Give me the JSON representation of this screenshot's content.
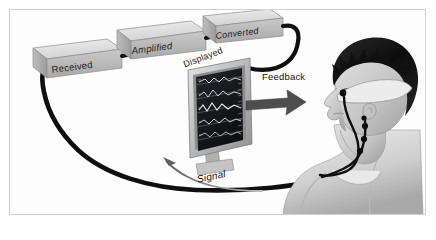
{
  "figure": {
    "kind": "biofeedback-system-diagram",
    "frame_border_color": "#cfd2d4",
    "background_color": "#fdfdfd",
    "cable_color": "#111111",
    "box_fill_color": "#d6d6d6",
    "arrow_color": "#5a5a5a"
  },
  "boxes": [
    {
      "label": "Received",
      "icon": "cube-icon"
    },
    {
      "label": "Amplified",
      "icon": "cube-icon"
    },
    {
      "label": "Converted",
      "icon": "cube-icon"
    }
  ],
  "monitor": {
    "label": "Displayed",
    "icon": "monitor-icon",
    "screen_color": "#17181c",
    "trace_color": "#d8dadd",
    "trace_count": 6
  },
  "arrows": [
    {
      "label": "Feedback",
      "direction": "right",
      "style": "thick-solid",
      "color": "#4e4e4e"
    },
    {
      "label": "Signal",
      "direction": "left",
      "style": "thin-curved",
      "color": "#7a7a7a"
    }
  ],
  "subject": {
    "icon": "person-head-profile-icon",
    "description": "man in profile facing left wearing a sensor headband",
    "hair_color": "#151515",
    "skin_color": "#cfcfcf",
    "headband_color": "#e8e8e8",
    "electrode_color": "#101010",
    "electrode_count": 5,
    "shirt_color": "#d9d9d9"
  }
}
